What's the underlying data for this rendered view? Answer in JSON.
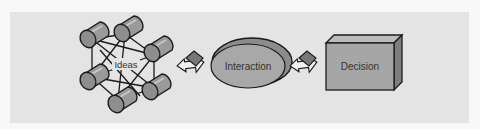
{
  "diagram": {
    "stages": [
      {
        "id": "ideas",
        "label": "Ideas",
        "shape": "network-of-cylinders"
      },
      {
        "id": "interaction",
        "label": "Interaction",
        "shape": "ellipse"
      },
      {
        "id": "decision",
        "label": "Decision",
        "shape": "box"
      }
    ],
    "connectors": [
      {
        "from": "ideas",
        "to": "interaction",
        "icon": "arrow-right-icon"
      },
      {
        "from": "interaction",
        "to": "decision",
        "icon": "arrow-right-icon"
      }
    ],
    "colors": {
      "panel": "#e4e4e4",
      "shape_fill": "#a6a6a6",
      "shape_side": "#8a8a8a",
      "shape_top": "#bdbdbd",
      "stroke": "#1a1a1a",
      "text": "#333333"
    }
  }
}
